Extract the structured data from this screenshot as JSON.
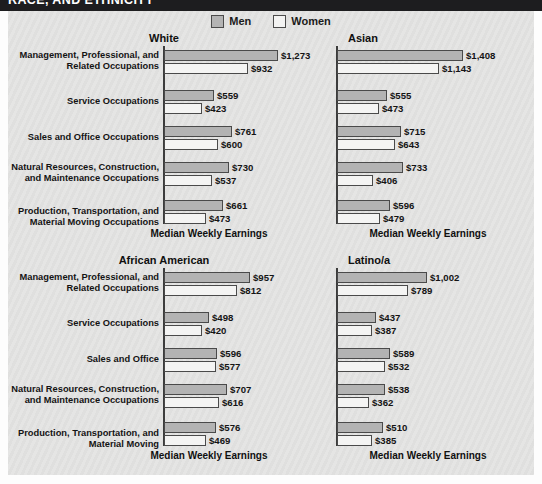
{
  "header": {
    "title": "RACE, AND ETHNICITY"
  },
  "legend": {
    "men_label": "Men",
    "women_label": "Women",
    "men_color": "#b3b3b3",
    "women_color": "#f4f4f3"
  },
  "axis_caption": "Median Weekly Earnings",
  "chart_data": [
    {
      "type": "bar",
      "title": "White",
      "xlabel": "Median Weekly Earnings",
      "ylabel": "",
      "orientation": "horizontal",
      "grid": false,
      "legend_position": "top-center",
      "xlim": [
        0,
        1450
      ],
      "categories": [
        "Management, Professional, and Related Occupations",
        "Service Occupations",
        "Sales and Office Occupations",
        "Natural Resources, Construction, and Maintenance Occupations",
        "Production, Transportation, and Material Moving Occupations"
      ],
      "series": [
        {
          "name": "Men",
          "values": [
            1273,
            559,
            761,
            730,
            661
          ],
          "labels": [
            "$1,273",
            "$559",
            "$761",
            "$730",
            "$661"
          ]
        },
        {
          "name": "Women",
          "values": [
            932,
            423,
            600,
            537,
            473
          ],
          "labels": [
            "$932",
            "$423",
            "$600",
            "$537",
            "$473"
          ]
        }
      ]
    },
    {
      "type": "bar",
      "title": "Asian",
      "xlabel": "Median Weekly Earnings",
      "ylabel": "",
      "orientation": "horizontal",
      "grid": false,
      "legend_position": "top-center",
      "xlim": [
        0,
        1450
      ],
      "categories": [
        "Management, Professional, and Related Occupations",
        "Service Occupations",
        "Sales and Office Occupations",
        "Natural Resources, Construction, and Maintenance Occupations",
        "Production, Transportation, and Material Moving Occupations"
      ],
      "series": [
        {
          "name": "Men",
          "values": [
            1408,
            555,
            715,
            733,
            596
          ],
          "labels": [
            "$1,408",
            "$555",
            "$715",
            "$733",
            "$596"
          ]
        },
        {
          "name": "Women",
          "values": [
            1143,
            473,
            643,
            406,
            479
          ],
          "labels": [
            "$1,143",
            "$473",
            "$643",
            "$406",
            "$479"
          ]
        }
      ]
    },
    {
      "type": "bar",
      "title": "African American",
      "xlabel": "Median Weekly Earnings",
      "ylabel": "",
      "orientation": "horizontal",
      "grid": false,
      "legend_position": "top-center",
      "xlim": [
        0,
        1450
      ],
      "categories": [
        "Management, Professional, and Related Occupations",
        "Service Occupations",
        "Sales and Office",
        "Natural Resources, Construction, and Maintenance Occupations",
        "Production, Transportation, and Material Moving"
      ],
      "series": [
        {
          "name": "Men",
          "values": [
            957,
            498,
            596,
            707,
            576
          ],
          "labels": [
            "$957",
            "$498",
            "$596",
            "$707",
            "$576"
          ]
        },
        {
          "name": "Women",
          "values": [
            812,
            420,
            577,
            616,
            469
          ],
          "labels": [
            "$812",
            "$420",
            "$577",
            "$616",
            "$469"
          ]
        }
      ]
    },
    {
      "type": "bar",
      "title": "Latino/a",
      "xlabel": "Median Weekly Earnings",
      "ylabel": "",
      "orientation": "horizontal",
      "grid": false,
      "legend_position": "top-center",
      "xlim": [
        0,
        1450
      ],
      "categories": [
        "Management, Professional, and Related Occupations",
        "Service Occupations",
        "Sales and Office",
        "Natural Resources, Construction, and Maintenance Occupations",
        "Production, Transportation, and Material Moving"
      ],
      "series": [
        {
          "name": "Men",
          "values": [
            1002,
            437,
            589,
            538,
            510
          ],
          "labels": [
            "$1,002",
            "$437",
            "$589",
            "$538",
            "$510"
          ]
        },
        {
          "name": "Women",
          "values": [
            789,
            387,
            532,
            362,
            385
          ],
          "labels": [
            "$789",
            "$387",
            "$532",
            "$362",
            "$385"
          ]
        }
      ]
    }
  ]
}
